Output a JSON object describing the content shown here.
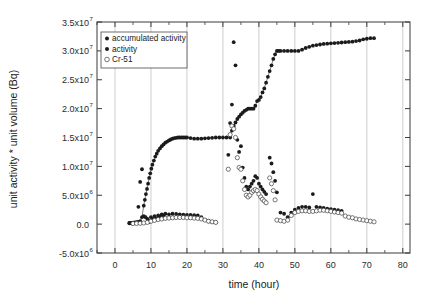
{
  "figure": {
    "background_color": "#ffffff",
    "frame_color": "#3a3a3a",
    "grid_color": "#b9b9b9"
  },
  "axes": {
    "x_title": "time (hour)",
    "y_title": "unit activity * unit volume (Bq)",
    "x_tick_labels": [
      "0",
      "10",
      "20",
      "30",
      "40",
      "50",
      "60",
      "70",
      "80"
    ],
    "y_tick_labels": [
      {
        "mantissa": "3.5x10",
        "exponent": "7"
      },
      {
        "mantissa": "3.0x10",
        "exponent": "7"
      },
      {
        "mantissa": "2.5x10",
        "exponent": "7"
      },
      {
        "mantissa": "2.0x10",
        "exponent": "7"
      },
      {
        "mantissa": "1.5x10",
        "exponent": "7"
      },
      {
        "mantissa": "1.0x10",
        "exponent": "7"
      },
      {
        "mantissa": "5.0x10",
        "exponent": "6"
      },
      {
        "mantissa": "0.0",
        "exponent": ""
      },
      {
        "mantissa": "-5.0x10",
        "exponent": "6"
      }
    ]
  },
  "legend": {
    "position": "top-left-inside",
    "entries": [
      {
        "label": "accumulated activity",
        "marker": "filled-circle",
        "color": "#1b1b1b"
      },
      {
        "label": "activity",
        "marker": "filled-circle",
        "color": "#1b1b1b"
      },
      {
        "label": "Cr-51",
        "marker": "open-circle",
        "color": "#3d3d3d"
      }
    ]
  },
  "chart_data": {
    "type": "scatter",
    "title": "",
    "xlabel": "time (hour)",
    "ylabel": "unit activity * unit volume (Bq)",
    "xlim": [
      -5,
      82
    ],
    "ylim": [
      -5000000,
      35000000
    ],
    "xticks": [
      0,
      10,
      20,
      30,
      40,
      50,
      60,
      70,
      80
    ],
    "yticks": [
      -5000000,
      0,
      5000000,
      10000000,
      15000000,
      20000000,
      25000000,
      30000000,
      35000000
    ],
    "grid": "vertical-only",
    "legend_position": "upper left",
    "series": [
      {
        "name": "accumulated activity",
        "marker": "filled-circle",
        "color": "#1b1b1b",
        "connected": true,
        "x": [
          4.0,
          4.5,
          5.0,
          5.5,
          6.0,
          6.5,
          7.0,
          7.5,
          8.0,
          8.3,
          8.6,
          8.9,
          9.2,
          9.5,
          9.8,
          10.1,
          10.4,
          10.8,
          11.2,
          11.6,
          12.0,
          12.5,
          13.0,
          13.5,
          14.0,
          14.5,
          15.0,
          15.5,
          16.0,
          16.5,
          17.0,
          17.5,
          18.0,
          18.5,
          19.0,
          19.5,
          20.0,
          21.0,
          22.0,
          23.0,
          24.0,
          25.0,
          26.0,
          27.0,
          28.0,
          29.0,
          30.0,
          31.0,
          32.0,
          32.5,
          33.0,
          33.5,
          34.0,
          34.5,
          35.0,
          35.5,
          36.0,
          36.5,
          37.0,
          37.5,
          38.0,
          38.5,
          39.0,
          39.5,
          40.0,
          40.5,
          41.0,
          41.5,
          42.0,
          42.5,
          43.0,
          43.5,
          44.0,
          44.5,
          45.0,
          45.5,
          46.0,
          47.0,
          48.0,
          49.0,
          50.0,
          51.0,
          52.0,
          53.0,
          54.0,
          55.0,
          56.0,
          57.0,
          58.0,
          59.0,
          60.0,
          61.0,
          62.0,
          63.0,
          64.0,
          65.0,
          66.0,
          67.0,
          68.0,
          69.0,
          70.0,
          71.0,
          72.0
        ],
        "y": [
          200000,
          200000,
          250000,
          300000,
          350000,
          400000,
          500000,
          1200000,
          3200000,
          4200000,
          5200000,
          6100000,
          7000000,
          8000000,
          8800000,
          9600000,
          10300000,
          11000000,
          11700000,
          12200000,
          12700000,
          13100000,
          13500000,
          13800000,
          14100000,
          14300000,
          14500000,
          14650000,
          14800000,
          14900000,
          14950000,
          15000000,
          15000000,
          15000000,
          15000000,
          15000000,
          15000000,
          14900000,
          14800000,
          14800000,
          14800000,
          14850000,
          14900000,
          14950000,
          15000000,
          15000000,
          15000000,
          15000000,
          15000000,
          16200000,
          17000000,
          17600000,
          18200000,
          18600000,
          19000000,
          19300000,
          19600000,
          19800000,
          20000000,
          20000000,
          20000000,
          20000000,
          20500000,
          21300000,
          21500000,
          22000000,
          22800000,
          23500000,
          24500000,
          25500000,
          26500000,
          27500000,
          28600000,
          29400000,
          30000000,
          30000000,
          30000000,
          30000000,
          30000000,
          30000000,
          30000000,
          30000000,
          30200000,
          30500000,
          30700000,
          30900000,
          31000000,
          31100000,
          31200000,
          31250000,
          31300000,
          31350000,
          31400000,
          31450000,
          31500000,
          31550000,
          31600000,
          31700000,
          31800000,
          32000000,
          32100000,
          32200000,
          32200000
        ]
      },
      {
        "name": "activity",
        "marker": "filled-circle",
        "color": "#1b1b1b",
        "connected": false,
        "x": [
          4.0,
          4.5,
          5.0,
          5.5,
          6.0,
          6.5,
          7.0,
          7.5,
          8.0,
          8.5,
          9.0,
          9.3,
          9.6,
          10.0,
          10.5,
          11.0,
          11.5,
          12.0,
          12.5,
          13.0,
          13.5,
          14.0,
          15.0,
          16.0,
          17.0,
          18.0,
          19.0,
          20.0,
          21.0,
          22.0,
          23.0,
          24.0,
          25.0,
          26.0,
          27.0,
          28.0,
          31.5,
          32.0,
          32.5,
          33.0,
          33.5,
          34.0,
          34.5,
          35.0,
          35.5,
          36.0,
          36.5,
          37.0,
          37.5,
          38.0,
          38.5,
          39.0,
          39.5,
          40.0,
          40.5,
          41.0,
          41.5,
          42.0,
          43.0,
          43.5,
          44.0,
          44.5,
          45.0,
          46.0,
          47.0,
          48.0,
          49.0,
          50.0,
          51.0,
          52.0,
          53.0,
          54.0,
          55.0,
          56.0,
          57.0,
          58.0,
          59.0,
          60.0,
          61.0,
          62.0,
          63.0
        ],
        "y": [
          150000,
          150000,
          180000,
          200000,
          250000,
          3000000,
          7300000,
          9500000,
          1400000,
          1200000,
          900000,
          600000,
          400000,
          1200000,
          900000,
          1400000,
          1000000,
          1500000,
          1300000,
          1700000,
          1500000,
          1800000,
          1700000,
          1800000,
          1750000,
          1700000,
          1650000,
          1600000,
          1600000,
          1550000,
          1500000,
          1200000,
          700000,
          500000,
          400000,
          300000,
          12000000,
          17500000,
          20700000,
          31500000,
          27500000,
          14600000,
          12500000,
          13500000,
          9800000,
          8000000,
          6500000,
          6000000,
          6500000,
          7000000,
          7500000,
          8300000,
          8000000,
          7000000,
          6500000,
          6000000,
          5600000,
          5200000,
          11500000,
          10500000,
          9000000,
          7500000,
          5500000,
          2000000,
          1800000,
          1200000,
          2000000,
          2500000,
          2800000,
          3000000,
          3000000,
          2900000,
          5200000,
          3000000,
          2900000,
          2800000,
          2700000,
          2600000,
          2500000,
          2400000,
          2300000
        ]
      },
      {
        "name": "Cr-51",
        "marker": "open-circle",
        "color": "#3d3d3d",
        "connected": false,
        "x": [
          5.0,
          6.0,
          7.0,
          8.0,
          9.0,
          10.0,
          11.0,
          12.0,
          13.0,
          14.0,
          15.0,
          16.0,
          17.0,
          18.0,
          19.0,
          20.0,
          21.0,
          22.0,
          23.0,
          24.0,
          25.0,
          26.0,
          27.0,
          28.0,
          31.5,
          32.0,
          32.5,
          33.0,
          33.5,
          34.0,
          34.5,
          35.0,
          35.5,
          36.0,
          36.5,
          37.0,
          37.5,
          38.0,
          38.5,
          39.0,
          39.5,
          40.0,
          40.5,
          41.0,
          41.5,
          42.0,
          43.0,
          43.5,
          44.0,
          44.5,
          45.0,
          46.0,
          47.0,
          48.0,
          49.0,
          50.0,
          51.0,
          52.0,
          53.0,
          54.0,
          55.0,
          56.0,
          57.0,
          58.0,
          59.0,
          60.0,
          61.0,
          62.0,
          63.0,
          64.0,
          65.0,
          66.0,
          67.0,
          68.0,
          69.0,
          70.0,
          71.0,
          72.0
        ],
        "y": [
          100000,
          120000,
          150000,
          200000,
          300000,
          500000,
          650000,
          800000,
          900000,
          1000000,
          1050000,
          1100000,
          1150000,
          1150000,
          1150000,
          1100000,
          1100000,
          1050000,
          1000000,
          900000,
          700000,
          500000,
          400000,
          300000,
          9500000,
          15500000,
          17000000,
          16500000,
          15000000,
          11500000,
          9800000,
          9500000,
          7500000,
          6000000,
          5000000,
          4700000,
          5000000,
          5500000,
          5800000,
          6000000,
          5800000,
          5200000,
          4700000,
          4300000,
          4000000,
          3700000,
          8000000,
          7000000,
          5800000,
          4200000,
          700000,
          600000,
          500000,
          700000,
          1500000,
          2000000,
          2200000,
          2300000,
          2300000,
          2200000,
          2200000,
          2300000,
          2400000,
          2400000,
          2300000,
          2200000,
          2100000,
          2000000,
          1900000,
          1400000,
          1200000,
          1100000,
          900000,
          800000,
          700000,
          600000,
          500000,
          400000
        ]
      }
    ]
  }
}
